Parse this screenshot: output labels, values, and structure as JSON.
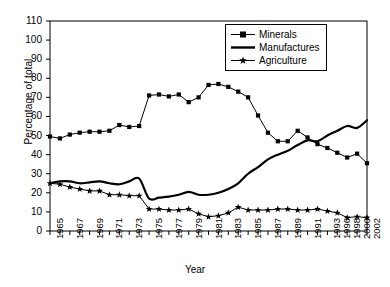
{
  "chart_data": {
    "type": "line",
    "title": "",
    "xlabel": "Year",
    "ylabel": "Percentage of total",
    "ylim": [
      0,
      110
    ],
    "ytick_step": 10,
    "grid": false,
    "legend_position": "top-right",
    "categories": [
      "1965",
      "1966",
      "1967",
      "1968",
      "1969",
      "1970",
      "1971",
      "1972",
      "1973",
      "1974",
      "1975",
      "1976",
      "1977",
      "1978",
      "1979",
      "1980",
      "1981",
      "1982",
      "1983",
      "1984",
      "1985",
      "1986",
      "1987",
      "1988",
      "1989",
      "1990",
      "1991",
      "1992",
      "1993",
      "1996",
      "1998",
      "2000",
      "2002"
    ],
    "xtick_labels": [
      "1965",
      "1967",
      "1969",
      "1971",
      "1973",
      "1975",
      "1977",
      "1979",
      "1981",
      "1983",
      "1985",
      "1987",
      "1989",
      "1991",
      "1993",
      "1996",
      "1998",
      "2000",
      "2002"
    ],
    "yticks": [
      0,
      10,
      20,
      30,
      40,
      50,
      60,
      70,
      80,
      90,
      100,
      110
    ],
    "series": [
      {
        "name": "Minerals",
        "marker": "square",
        "values": [
          49.5,
          48.5,
          50.5,
          51.5,
          52,
          52,
          52.5,
          55.5,
          54.5,
          55,
          71,
          71.5,
          70.5,
          71.5,
          67.5,
          70,
          76.5,
          77,
          75.5,
          73,
          70,
          60.5,
          51.5,
          47,
          47,
          52.5,
          49,
          45.5,
          43.5,
          41,
          38.5,
          40.5,
          35.5
        ]
      },
      {
        "name": "Manufactures",
        "marker": "none",
        "values": [
          25,
          26,
          26,
          25,
          25.5,
          26,
          25,
          24.5,
          26,
          27.5,
          17,
          17.5,
          18,
          19,
          20.5,
          19,
          19,
          20,
          22,
          25,
          30,
          33.5,
          37.5,
          40,
          42,
          45,
          47.5,
          47,
          50,
          52.5,
          55,
          54,
          58
        ]
      },
      {
        "name": "Agriculture",
        "marker": "star",
        "values": [
          25,
          24.5,
          23,
          22,
          21,
          21,
          19,
          19,
          18.5,
          18.5,
          11.5,
          11.5,
          11,
          11,
          11.5,
          9,
          7.5,
          8,
          9.5,
          12.5,
          11,
          11,
          11,
          11.5,
          11.5,
          11,
          11,
          11.5,
          10.5,
          9.5,
          7,
          7.5,
          7
        ]
      }
    ]
  },
  "legend": {
    "items": [
      {
        "label": "Minerals"
      },
      {
        "label": "Manufactures"
      },
      {
        "label": "Agriculture"
      }
    ]
  }
}
